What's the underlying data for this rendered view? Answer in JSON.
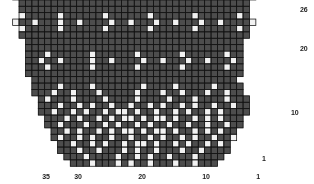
{
  "chart_title": "Snowflake Knitting Chart",
  "colors": {
    "background": "#ffffff",
    "stitch_dark": "#4d4d4d",
    "stitch_light": "#f2f2f2",
    "gridline": "#141414",
    "label": "#1c1c1c"
  },
  "geometry": {
    "cell_width": 6.4,
    "cell_height": 6.4,
    "grid_left": 6.0,
    "grid_bottom_y": 166.0,
    "rows": 26,
    "columns": 40
  },
  "axes": {
    "row_axis_side": "right",
    "column_axis_side": "bottom",
    "row_labels": [
      {
        "text": "26",
        "row": 26,
        "x": 300,
        "y": 6
      },
      {
        "text": "20",
        "row": 20,
        "x": 300,
        "y": 45
      },
      {
        "text": "10",
        "row": 10,
        "x": 291,
        "y": 109
      },
      {
        "text": "1",
        "row": 1,
        "x": 262,
        "y": 155
      }
    ],
    "column_labels": [
      {
        "text": "35",
        "column": 35,
        "x": 46,
        "y": 173
      },
      {
        "text": "30",
        "column": 30,
        "x": 78,
        "y": 173
      },
      {
        "text": "20",
        "column": 20,
        "x": 142,
        "y": 173
      },
      {
        "text": "10",
        "column": 10,
        "x": 206,
        "y": 173
      },
      {
        "text": "1",
        "column": 1,
        "x": 258,
        "y": 173
      }
    ]
  },
  "legend": {
    "dark_meaning": "main colour stitch",
    "light_meaning": "contrast colour stitch"
  },
  "chart_data": {
    "type": "heatmap",
    "xlabel": "",
    "ylabel": "",
    "read_direction": "right-to-left, bottom-to-top",
    "rows": 26,
    "columns": 40,
    "value_legend": {
      "0": "empty / no stitch",
      "1": "dark stitch",
      "2": "light stitch"
    },
    "grid_rows_top_to_bottom": [
      "0111111111111111111111111111111111111110",
      "0111111111111111111111111111111111111110",
      "0111121111112111111211111121111112111110",
      "0111211211112112111211211121121112112110",
      "0111121111112111111211111121111112111110",
      "0111111111111111111111111111111111111110",
      "0011111111111111111111111111111111111100",
      "0011111111111111111111111111111111111100",
      "0021111121111112111111211111121111112100",
      "0211211121121111211211121121112112111120",
      "0021111121111112111111211111121111112100",
      "0011111111111111111111111111111111111100",
      "0001111111111111111111111111111111111000",
      "0001111111111111111111111111111111111000",
      "0001112111111211111121111112111111211000",
      "0001121121111211211112112111211211121000",
      "0001112111111211111121111112111111211000",
      "0001111111111111111111111111111111111000",
      "0000111111111111111111111111111111110000",
      "0000111121111211111112111121111121111000",
      "0000111211211121111121112112111211211000",
      "0000012111211112111121111211121111211100",
      "0000011121121211211211212112121121121100",
      "0000011211212112122121121121211212111100",
      "0000001112121121212212122121121212111000",
      "0000001121112112121121211211211211211000",
      "0000000112121121212212122121121212110000",
      "0000000121121211211211212112121121120000",
      "0000000011211212112122121121211212100000",
      "0000000011121121112121121112112111100000",
      "0000000001112111121121211211121111000000",
      "0000000000111211121211211121121110000000"
    ],
    "motifs": [
      {
        "name": "small-cross",
        "repeat_count_per_band": 5,
        "bands": 3,
        "size": "3x3 plus"
      },
      {
        "name": "large-snowflake",
        "repeat_count": 3,
        "size": "13x13"
      }
    ]
  }
}
